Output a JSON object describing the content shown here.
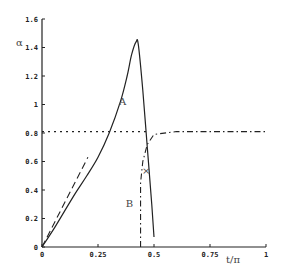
{
  "chart_data": {
    "type": "line",
    "title": "",
    "xlabel": "t/π",
    "ylabel": "α",
    "xlim": [
      0,
      1
    ],
    "ylim": [
      0,
      1.6
    ],
    "grid": false,
    "xticks": [
      "0",
      "0.25",
      "0.5",
      "0.75",
      "1"
    ],
    "yticks": [
      "0",
      "0.2",
      "0.4",
      "0.6",
      "0.8",
      "1",
      "1.2",
      "1.4",
      "1.6"
    ],
    "series": [
      {
        "name": "A",
        "style": "solid",
        "x": [
          0,
          0.05,
          0.1,
          0.15,
          0.2,
          0.25,
          0.3,
          0.35,
          0.38,
          0.4,
          0.42,
          0.43,
          0.45,
          0.47,
          0.49,
          0.5
        ],
        "y": [
          0,
          0.12,
          0.25,
          0.38,
          0.5,
          0.63,
          0.8,
          1.02,
          1.2,
          1.35,
          1.44,
          1.42,
          1.1,
          0.7,
          0.3,
          0.07
        ]
      },
      {
        "name": "initial-slope",
        "style": "dashed",
        "x": [
          0,
          0.205
        ],
        "y": [
          0,
          0.63
        ]
      },
      {
        "name": "B",
        "style": "dash-dot",
        "x": [
          0.44,
          0.44,
          0.45,
          0.47,
          0.5,
          0.6,
          0.75,
          1.0
        ],
        "y": [
          0,
          0.45,
          0.6,
          0.72,
          0.79,
          0.81,
          0.81,
          0.81
        ]
      },
      {
        "name": "reference-0.8",
        "style": "dotted",
        "x": [
          0,
          0.48
        ],
        "y": [
          0.81,
          0.81
        ]
      }
    ],
    "annotations": [
      {
        "text": "A",
        "x": 0.36,
        "y": 1.0
      },
      {
        "text": "B",
        "x": 0.39,
        "y": 0.28
      },
      {
        "text": "×",
        "x": 0.465,
        "y": 0.54
      }
    ]
  },
  "labels": {
    "ylabel": "α",
    "xlabel": "t/π",
    "curveA": "A",
    "curveB": "B",
    "marker": "×"
  }
}
